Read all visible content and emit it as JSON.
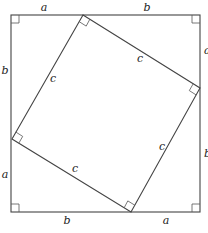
{
  "diagram": {
    "outer_square": {
      "x1": 11,
      "y1": 15,
      "x2": 200,
      "y2": 212
    },
    "inner_square_vertices": [
      {
        "name": "top",
        "x": 83,
        "y": 15
      },
      {
        "name": "right",
        "x": 200,
        "y": 88
      },
      {
        "name": "bottom",
        "x": 131,
        "y": 212
      },
      {
        "name": "left",
        "x": 12,
        "y": 139
      }
    ],
    "labels": {
      "top_a": "a",
      "top_b": "b",
      "right_a": "a",
      "right_b": "b",
      "bottom_b": "b",
      "bottom_a": "a",
      "left_b": "b",
      "left_a": "a",
      "inner_top_left_c": "c",
      "inner_top_right_c": "c",
      "inner_bottom_right_c": "c",
      "inner_bottom_left_c": "c"
    },
    "stroke_color": "#444444",
    "background": "#ffffff"
  }
}
